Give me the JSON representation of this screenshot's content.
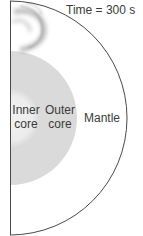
{
  "figure": {
    "title": "Time = 300 s",
    "layers": [
      {
        "name": "Inner core",
        "label_line1": "Inner",
        "label_line2": "core",
        "color": "#ececec"
      },
      {
        "name": "Outer core",
        "label_line1": "Outer",
        "label_line2": "core",
        "color": "#dadada"
      },
      {
        "name": "Mantle",
        "label_line1": "Mantle",
        "color": "#ffffff"
      }
    ],
    "colors": {
      "outline": "#4a4a4a",
      "wavefront_shadow": "#9a9a9a",
      "text": "#3a3a3a"
    }
  }
}
